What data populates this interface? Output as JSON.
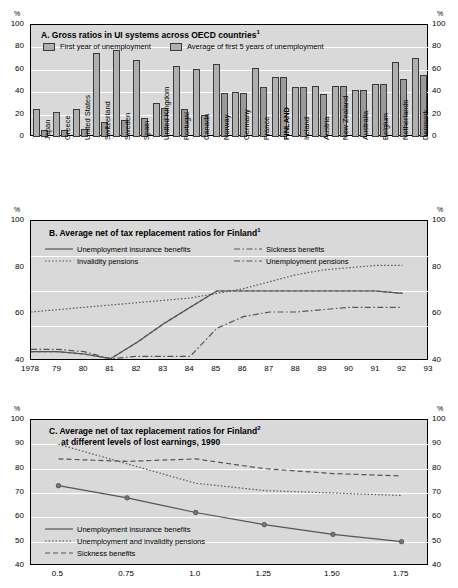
{
  "units": {
    "pct": "%"
  },
  "panelA": {
    "title": "A.  Gross ratios in UI systems across OECD countries",
    "title_sup": "1",
    "legend": [
      {
        "label": "First year of unemployment"
      },
      {
        "label": "Average of first 5 years of unemployment"
      }
    ],
    "yticks": [
      "0",
      "20",
      "40",
      "60",
      "80",
      "100"
    ]
  },
  "panelB": {
    "title": "B.  Average net of tax replacement ratios for Finland",
    "title_sup": "1",
    "legend": [
      {
        "label": "Unemployment insurance benefits"
      },
      {
        "label": "Sickness benefits"
      },
      {
        "label": "Invalidity pensions"
      },
      {
        "label": "Unemployment pensions"
      }
    ],
    "yticks": [
      "40",
      "60",
      "80",
      "100"
    ]
  },
  "panelC": {
    "title_line1": "C.  Average net of tax replacement ratios for Finland",
    "title_sup": "2",
    "title_line2": "at different levels of lost earnings, 1990",
    "legend": [
      {
        "label": "Unemployment insurance benefits"
      },
      {
        "label": "Unemployment and invalidity pensions"
      },
      {
        "label": "Sickness benefits"
      }
    ],
    "yticks": [
      "40",
      "50",
      "60",
      "70",
      "80",
      "90",
      "100"
    ]
  },
  "chart_data": [
    {
      "type": "bar",
      "title": "A. Gross ratios in UI systems across OECD countries",
      "xlabel": "",
      "ylabel": "%",
      "ylim": [
        0,
        100
      ],
      "grid": true,
      "legend_position": "top-left",
      "categories": [
        "Japan",
        "Greece",
        "United States",
        "Switzerland",
        "Sweden",
        "Spain",
        "United Kingdom",
        "Portugal",
        "Canada",
        "Norway",
        "Germany",
        "France",
        "FINLAND",
        "Ireland",
        "Austria",
        "New Zealand",
        "Australia",
        "Belgium",
        "Netherlands",
        "Denmark"
      ],
      "series": [
        {
          "name": "First year of unemployment",
          "values": [
            25,
            22,
            25,
            75,
            78,
            69,
            30,
            63,
            61,
            65,
            40,
            62,
            54,
            45,
            46,
            46,
            42,
            47,
            67,
            71
          ]
        },
        {
          "name": "Average of first 5 years of unemployment",
          "values": [
            6,
            6,
            7,
            13,
            15,
            17,
            26,
            25,
            20,
            39,
            39,
            45,
            54,
            45,
            38,
            46,
            42,
            47,
            52,
            55
          ]
        }
      ]
    },
    {
      "type": "line",
      "title": "B. Average net of tax replacement ratios for Finland",
      "xlabel": "",
      "ylabel": "%",
      "ylim": [
        40,
        100
      ],
      "xlim": [
        1978,
        1993
      ],
      "grid": true,
      "legend_position": "top",
      "x": [
        1978,
        1979,
        1980,
        1981,
        1982,
        1983,
        1984,
        1985,
        1986,
        1987,
        1988,
        1989,
        1990,
        1991,
        1992,
        1993
      ],
      "series": [
        {
          "name": "Unemployment insurance benefits",
          "values": [
            44,
            44,
            43,
            41,
            48,
            56,
            63,
            70,
            70,
            70,
            70,
            70,
            70,
            70,
            69,
            null
          ]
        },
        {
          "name": "Invalidity pensions",
          "values": [
            61,
            62,
            63,
            64,
            65,
            66,
            67,
            69,
            71,
            74,
            77,
            79,
            80,
            81,
            81,
            null
          ]
        },
        {
          "name": "Sickness benefits",
          "values": [
            44,
            44,
            43,
            41,
            48,
            56,
            63,
            70,
            70,
            70,
            70,
            70,
            70,
            70,
            69,
            null
          ]
        },
        {
          "name": "Unemployment pensions",
          "values": [
            45,
            45,
            44,
            41,
            42,
            42,
            42,
            54,
            59,
            61,
            61,
            62,
            63,
            63,
            63,
            null
          ]
        }
      ]
    },
    {
      "type": "line",
      "title": "C. Average net of tax replacement ratios for Finland at different levels of lost earnings, 1990",
      "xlabel": "",
      "ylabel": "%",
      "ylim": [
        40,
        100
      ],
      "xlim": [
        0.4,
        1.85
      ],
      "grid": true,
      "legend_position": "bottom-left",
      "x": [
        0.5,
        0.75,
        1.0,
        1.25,
        1.5,
        1.75
      ],
      "xticks": [
        "0.5",
        "0.75",
        "1.0",
        "1.25",
        "1.50",
        "1.75"
      ],
      "series": [
        {
          "name": "Unemployment insurance benefits",
          "values": [
            73,
            68,
            62,
            57,
            53,
            50
          ]
        },
        {
          "name": "Unemployment and invalidity pensions",
          "values": [
            90,
            82,
            74,
            71,
            70,
            69
          ]
        },
        {
          "name": "Sickness benefits",
          "values": [
            84,
            83,
            84,
            80,
            78,
            77
          ]
        }
      ]
    }
  ]
}
